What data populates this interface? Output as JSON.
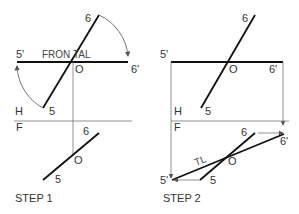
{
  "step1": {
    "caption": "STEP 1",
    "top_labels": {
      "p6": "6",
      "p5prime": "5'",
      "frontal": "FRON  TAL",
      "p6prime": "6'",
      "o": "O",
      "h": "H",
      "p5": "5"
    },
    "bottom_labels": {
      "f": "F",
      "p6": "6",
      "o": "O",
      "p5": "5"
    }
  },
  "step2": {
    "caption": "STEP 2",
    "top_labels": {
      "p6": "6",
      "p5prime": "5'",
      "o": "O",
      "p6prime": "6'",
      "h": "H",
      "p5": "5"
    },
    "bottom_labels": {
      "f": "F",
      "p6": "6",
      "p6prime": "6'",
      "tl": "TL",
      "o": "O",
      "p5prime": "5'",
      "p5": "5"
    }
  },
  "colors": {
    "line": "#111111",
    "projection": "#777777",
    "text": "#333333"
  }
}
